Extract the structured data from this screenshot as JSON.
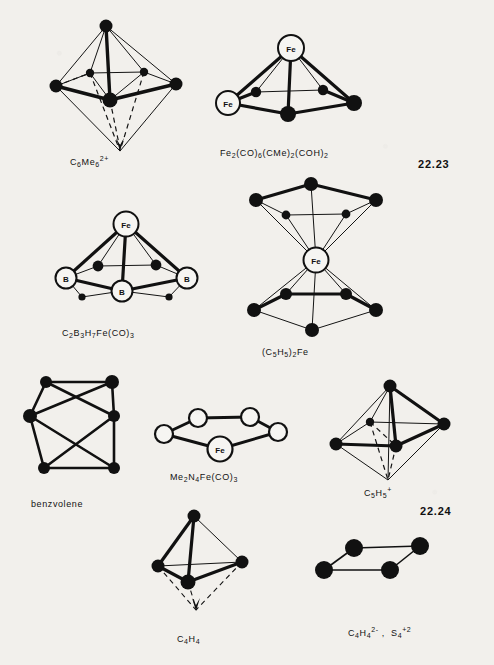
{
  "page": {
    "background_color": "#f2f0ec",
    "ink_color": "#111111",
    "kind": "scanned textbook figure page",
    "section_numbers": [
      {
        "id": "sec-22-23",
        "text": "22.23"
      },
      {
        "id": "sec-22-24",
        "text": "22.24"
      }
    ]
  },
  "figures": [
    {
      "id": "c6me6",
      "name": "octahedron-c6me6",
      "caption_parts": [
        {
          "t": "C",
          "k": "base"
        },
        {
          "t": "6",
          "k": "sub"
        },
        {
          "t": "Me",
          "k": "base"
        },
        {
          "t": "6",
          "k": "sub"
        },
        {
          "t": "2+",
          "k": "sup"
        }
      ],
      "caption_plain": "C6Me6 2+",
      "shape": "bicapped square / octahedron with dashed lower apex",
      "vertices": [
        {
          "label": "",
          "type": "filled-large"
        },
        {
          "label": "",
          "type": "filled-large"
        },
        {
          "label": "",
          "type": "filled-large"
        },
        {
          "label": "",
          "type": "filled-large"
        },
        {
          "label": "",
          "type": "filled-small"
        },
        {
          "label": "",
          "type": "filled-small"
        }
      ]
    },
    {
      "id": "fe2co6",
      "name": "square-pyramid-fe2",
      "caption_parts": [
        {
          "t": "Fe",
          "k": "base"
        },
        {
          "t": "2",
          "k": "sub"
        },
        {
          "t": "(CO)",
          "k": "base"
        },
        {
          "t": "6",
          "k": "sub"
        },
        {
          "t": "(CMe)",
          "k": "base"
        },
        {
          "t": "2",
          "k": "sub"
        },
        {
          "t": "(COH)",
          "k": "base"
        },
        {
          "t": "2",
          "k": "sub"
        }
      ],
      "caption_plain": "Fe2(CO)6(CMe)2(COH)2",
      "shape": "square pyramid, two open Fe vertices",
      "vertices": [
        {
          "label": "Fe",
          "type": "open"
        },
        {
          "label": "Fe",
          "type": "open"
        },
        {
          "label": "",
          "type": "filled-large"
        },
        {
          "label": "",
          "type": "filled-large"
        },
        {
          "label": "",
          "type": "filled-small"
        },
        {
          "label": "",
          "type": "filled-small"
        }
      ]
    },
    {
      "id": "c2b3h7fe",
      "name": "carborane-cluster",
      "caption_parts": [
        {
          "t": "C",
          "k": "base"
        },
        {
          "t": "2",
          "k": "sub"
        },
        {
          "t": "B",
          "k": "base"
        },
        {
          "t": "3",
          "k": "sub"
        },
        {
          "t": "H",
          "k": "base"
        },
        {
          "t": "7",
          "k": "sub"
        },
        {
          "t": "Fe(CO)",
          "k": "base"
        },
        {
          "t": "3",
          "k": "sub"
        }
      ],
      "caption_plain": "C2B3H7Fe(CO)3",
      "shape": "square pyramid with apical Fe and three B vertices",
      "vertices": [
        {
          "label": "Fe",
          "type": "open"
        },
        {
          "label": "B",
          "type": "open"
        },
        {
          "label": "B",
          "type": "open"
        },
        {
          "label": "B",
          "type": "open"
        },
        {
          "label": "",
          "type": "filled-mid"
        },
        {
          "label": "",
          "type": "filled-mid"
        },
        {
          "label": "",
          "type": "filled-tiny"
        },
        {
          "label": "",
          "type": "filled-tiny"
        }
      ]
    },
    {
      "id": "ferrocene",
      "name": "ferrocene-sandwich",
      "caption_parts": [
        {
          "t": "(C",
          "k": "base"
        },
        {
          "t": "5",
          "k": "sub"
        },
        {
          "t": "H",
          "k": "base"
        },
        {
          "t": "5",
          "k": "sub"
        },
        {
          "t": ")",
          "k": "base"
        },
        {
          "t": "2",
          "k": "sub"
        },
        {
          "t": "Fe",
          "k": "base"
        }
      ],
      "caption_plain": "(C5H5)2Fe",
      "shape": "two pentagonal rings sandwiching central Fe",
      "vertices": [
        {
          "label": "Fe",
          "type": "open"
        },
        {
          "label": "",
          "type": "filled-large"
        },
        {
          "label": "",
          "type": "filled-large"
        },
        {
          "label": "",
          "type": "filled-large"
        },
        {
          "label": "",
          "type": "filled-small"
        },
        {
          "label": "",
          "type": "filled-small"
        }
      ]
    },
    {
      "id": "benzvolene",
      "name": "benzvolene-cage",
      "caption_parts": [
        {
          "t": "benzvolene",
          "k": "base"
        }
      ],
      "caption_plain": "benzvolene",
      "shape": "elongated cage / bicapped antiprism with crossing edges",
      "vertices": [
        {
          "label": "",
          "type": "filled-large"
        },
        {
          "label": "",
          "type": "filled-large"
        },
        {
          "label": "",
          "type": "filled-large"
        },
        {
          "label": "",
          "type": "filled-large"
        },
        {
          "label": "",
          "type": "filled-large"
        },
        {
          "label": "",
          "type": "filled-large"
        }
      ]
    },
    {
      "id": "me2n4fe",
      "name": "planar-ring-fe",
      "caption_parts": [
        {
          "t": "Me",
          "k": "base"
        },
        {
          "t": "2",
          "k": "sub"
        },
        {
          "t": "N",
          "k": "base"
        },
        {
          "t": "4",
          "k": "sub"
        },
        {
          "t": "Fe(CO)",
          "k": "base"
        },
        {
          "t": "3",
          "k": "sub"
        }
      ],
      "caption_plain": "Me2N4Fe(CO)3",
      "shape": "planar five-membered ring drawn in perspective",
      "vertices": [
        {
          "label": "Fe",
          "type": "open"
        },
        {
          "label": "",
          "type": "open"
        },
        {
          "label": "",
          "type": "open"
        },
        {
          "label": "",
          "type": "open"
        },
        {
          "label": "",
          "type": "open"
        }
      ]
    },
    {
      "id": "c5h5plus",
      "name": "octahedron-c5h5-cation",
      "caption_parts": [
        {
          "t": "C",
          "k": "base"
        },
        {
          "t": "5",
          "k": "base"
        },
        {
          "t": "H",
          "k": "base"
        },
        {
          "t": "5",
          "k": "sub"
        },
        {
          "t": "+",
          "k": "sup"
        }
      ],
      "caption_plain": "C5H5 +",
      "shape": "octahedron with dashed rear/lower edges",
      "vertices": [
        {
          "label": "",
          "type": "filled-large"
        },
        {
          "label": "",
          "type": "filled-large"
        },
        {
          "label": "",
          "type": "filled-large"
        },
        {
          "label": "",
          "type": "filled-small"
        }
      ]
    },
    {
      "id": "c4h4",
      "name": "tetrahedron-c4h4",
      "caption_parts": [
        {
          "t": "C",
          "k": "base"
        },
        {
          "t": "4",
          "k": "sub"
        },
        {
          "t": "H",
          "k": "base"
        },
        {
          "t": "4",
          "k": "sub"
        }
      ],
      "caption_plain": "C4H4",
      "shape": "tetrahedron with dashed lower apex",
      "vertices": [
        {
          "label": "",
          "type": "filled-large"
        },
        {
          "label": "",
          "type": "filled-large"
        },
        {
          "label": "",
          "type": "filled-large"
        },
        {
          "label": "",
          "type": "filled-large"
        }
      ]
    },
    {
      "id": "c4h4-s4",
      "name": "planar-square-c4h4-s4",
      "caption_parts": [
        {
          "t": "C",
          "k": "base"
        },
        {
          "t": "4",
          "k": "sub"
        },
        {
          "t": "H",
          "k": "base"
        },
        {
          "t": "4",
          "k": "sub"
        },
        {
          "t": "2-",
          "k": "sup"
        },
        {
          "t": " ,  ",
          "k": "base"
        },
        {
          "t": "S",
          "k": "base"
        },
        {
          "t": "4",
          "k": "sub"
        },
        {
          "t": "+2",
          "k": "sup"
        }
      ],
      "caption_plain": "C4H4 2- , S4 +2",
      "shape": "planar rhombus / square in perspective",
      "vertices": [
        {
          "label": "",
          "type": "filled-large"
        },
        {
          "label": "",
          "type": "filled-large"
        },
        {
          "label": "",
          "type": "filled-large"
        },
        {
          "label": "",
          "type": "filled-large"
        }
      ]
    }
  ]
}
